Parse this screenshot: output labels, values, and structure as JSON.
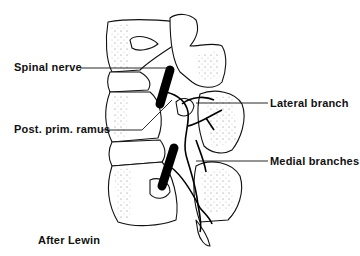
{
  "figure": {
    "labels": {
      "spinal_nerve": "Spinal nerve",
      "post_prim_ramus": "Post. prim. ramus",
      "lateral_branch": "Lateral branch",
      "medial_branches": "Medial branches"
    },
    "credit": "After Lewin"
  }
}
